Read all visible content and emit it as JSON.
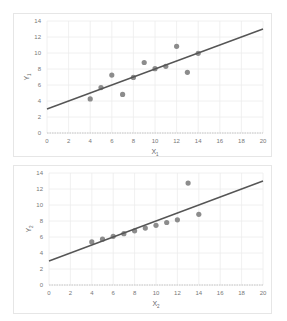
{
  "chart_data": [
    {
      "type": "scatter",
      "title": "",
      "xlabel": "X1",
      "ylabel": "Y1",
      "xlim": [
        0,
        20
      ],
      "ylim": [
        0,
        14
      ],
      "xticks": [
        0,
        2,
        4,
        6,
        8,
        10,
        12,
        14,
        16,
        18,
        20
      ],
      "yticks": [
        0,
        2,
        4,
        6,
        8,
        10,
        12,
        14
      ],
      "grid": true,
      "points": {
        "x": [
          10,
          8,
          13,
          9,
          11,
          14,
          6,
          4,
          12,
          7,
          5
        ],
        "y": [
          8.04,
          6.95,
          7.58,
          8.81,
          8.33,
          9.96,
          7.24,
          4.26,
          10.84,
          4.82,
          5.68
        ]
      },
      "trendline": {
        "intercept": 3.0,
        "slope": 0.5,
        "x_range": [
          0,
          20
        ]
      },
      "marker_color": "#8c8c8c",
      "line_color": "#555555"
    },
    {
      "type": "scatter",
      "title": "",
      "xlabel": "X2",
      "ylabel": "Y2",
      "xlim": [
        0,
        20
      ],
      "ylim": [
        0,
        14
      ],
      "xticks": [
        0,
        2,
        4,
        6,
        8,
        10,
        12,
        14,
        16,
        18,
        20
      ],
      "yticks": [
        0,
        2,
        4,
        6,
        8,
        10,
        12,
        14
      ],
      "grid": true,
      "points": {
        "x": [
          10,
          8,
          13,
          9,
          11,
          14,
          6,
          4,
          12,
          7,
          5
        ],
        "y": [
          7.46,
          6.77,
          12.74,
          7.11,
          7.81,
          8.84,
          6.08,
          5.39,
          8.15,
          6.42,
          5.73
        ]
      },
      "trendline": {
        "intercept": 3.0,
        "slope": 0.5,
        "x_range": [
          0,
          20
        ]
      },
      "marker_color": "#8c8c8c",
      "line_color": "#555555"
    }
  ],
  "labels": {
    "c1": {
      "x_main": "X",
      "x_sub": "1",
      "y_main": "Y",
      "y_sub": "1"
    },
    "c2": {
      "x_main": "X",
      "x_sub": "2",
      "y_main": "Y",
      "y_sub": "2"
    }
  }
}
